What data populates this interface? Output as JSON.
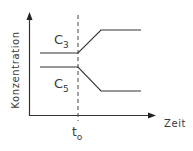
{
  "diagram": {
    "type": "concentration-time sketch",
    "y_axis_label": "Konzentration",
    "x_axis_label": "Zeit",
    "time_marker": {
      "label_main": "t",
      "label_sub": "o"
    },
    "curves": [
      {
        "id": "c3",
        "label_main": "C",
        "label_sub": "3",
        "behavior": "constant, then increases after t0, then constant at higher level"
      },
      {
        "id": "c5",
        "label_main": "C",
        "label_sub": "5",
        "behavior": "constant, then decreases after t0, then constant at lower level"
      }
    ],
    "colors": {
      "line": "#333333",
      "background": "#ffffff"
    }
  }
}
